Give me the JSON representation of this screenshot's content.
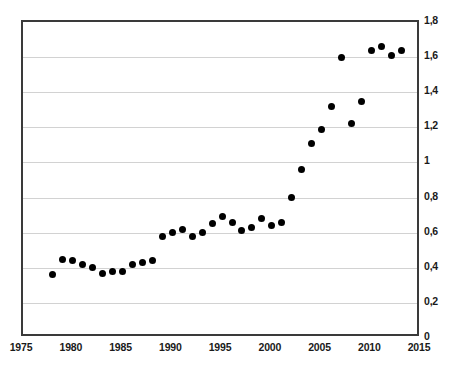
{
  "chart_data": {
    "type": "scatter",
    "title": "",
    "subtitle": "",
    "xlabel": "",
    "ylabel": "",
    "xlim": [
      1975,
      2015
    ],
    "ylim": [
      0,
      1.8
    ],
    "grid": true,
    "legend": null,
    "x_tick_labels": [
      "1975",
      "1980",
      "1985",
      "1990",
      "1995",
      "2000",
      "2005",
      "2010",
      "2015"
    ],
    "x_ticks": [
      1975,
      1980,
      1985,
      1990,
      1995,
      2000,
      2005,
      2010,
      2015
    ],
    "y_tick_labels": [
      "0",
      "0,2",
      "0,4",
      "0,6",
      "0,8",
      "1",
      "1,2",
      "1,4",
      "1,6",
      "1,8"
    ],
    "y_ticks": [
      0,
      0.2,
      0.4,
      0.6,
      0.8,
      1.0,
      1.2,
      1.4,
      1.6,
      1.8
    ],
    "decimal_separator": ",",
    "marker": {
      "shape": "circle",
      "color": "#000000",
      "size": 7
    },
    "x": [
      1978,
      1979,
      1980,
      1981,
      1982,
      1983,
      1984,
      1985,
      1986,
      1987,
      1988,
      1989,
      1990,
      1991,
      1992,
      1993,
      1994,
      1995,
      1996,
      1997,
      1998,
      1999,
      2000,
      2001,
      2002,
      2003,
      2004,
      2005,
      2006,
      2007,
      2008,
      2009,
      2010,
      2011,
      2012,
      2013
    ],
    "values": [
      0.36,
      0.45,
      0.44,
      0.42,
      0.4,
      0.37,
      0.38,
      0.38,
      0.42,
      0.43,
      0.44,
      0.58,
      0.6,
      0.62,
      0.58,
      0.6,
      0.65,
      0.69,
      0.66,
      0.61,
      0.63,
      0.68,
      0.64,
      0.66,
      0.8,
      0.96,
      1.11,
      1.19,
      1.32,
      1.6,
      1.22,
      1.35,
      1.64,
      1.66,
      1.61,
      1.64
    ],
    "points": [
      {
        "x": 1978,
        "y": 0.36
      },
      {
        "x": 1979,
        "y": 0.45
      },
      {
        "x": 1980,
        "y": 0.44
      },
      {
        "x": 1981,
        "y": 0.42
      },
      {
        "x": 1982,
        "y": 0.4
      },
      {
        "x": 1983,
        "y": 0.37
      },
      {
        "x": 1984,
        "y": 0.38
      },
      {
        "x": 1985,
        "y": 0.38
      },
      {
        "x": 1986,
        "y": 0.42
      },
      {
        "x": 1987,
        "y": 0.43
      },
      {
        "x": 1988,
        "y": 0.44
      },
      {
        "x": 1989,
        "y": 0.58
      },
      {
        "x": 1990,
        "y": 0.6
      },
      {
        "x": 1991,
        "y": 0.62
      },
      {
        "x": 1992,
        "y": 0.58
      },
      {
        "x": 1993,
        "y": 0.6
      },
      {
        "x": 1994,
        "y": 0.65
      },
      {
        "x": 1995,
        "y": 0.69
      },
      {
        "x": 1996,
        "y": 0.66
      },
      {
        "x": 1997,
        "y": 0.61
      },
      {
        "x": 1998,
        "y": 0.63
      },
      {
        "x": 1999,
        "y": 0.68
      },
      {
        "x": 2000,
        "y": 0.64
      },
      {
        "x": 2001,
        "y": 0.66
      },
      {
        "x": 2002,
        "y": 0.8
      },
      {
        "x": 2003,
        "y": 0.96
      },
      {
        "x": 2004,
        "y": 1.11
      },
      {
        "x": 2005,
        "y": 1.19
      },
      {
        "x": 2006,
        "y": 1.32
      },
      {
        "x": 2007,
        "y": 1.6
      },
      {
        "x": 2008,
        "y": 1.22
      },
      {
        "x": 2009,
        "y": 1.35
      },
      {
        "x": 2010,
        "y": 1.64
      },
      {
        "x": 2011,
        "y": 1.66
      },
      {
        "x": 2012,
        "y": 1.61
      },
      {
        "x": 2013,
        "y": 1.64
      }
    ]
  }
}
